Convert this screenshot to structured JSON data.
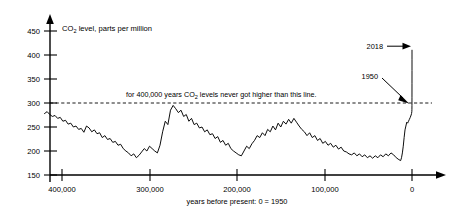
{
  "chart_data": {
    "type": "line",
    "title": "CO2 level, parts per million",
    "title_parts": {
      "pre": "CO",
      "sub": "2",
      "post": " level, parts per million"
    },
    "xlabel": "years before present: 0 = 1950",
    "ylabel": "CO2 level, parts per million",
    "xlim": [
      440000,
      -12000
    ],
    "ylim": [
      150,
      470
    ],
    "x_axis_direction": "decreasing-left-to-right",
    "grid": false,
    "legend": null,
    "y_ticks": [
      150,
      200,
      250,
      300,
      350,
      400,
      450
    ],
    "y_tick_labels": [
      "150",
      "200",
      "250",
      "300",
      "350",
      "400",
      "450"
    ],
    "x_ticks": [
      400000,
      300000,
      200000,
      100000,
      0
    ],
    "x_tick_labels": [
      "400,000",
      "300,000",
      "200,000",
      "100,000",
      "0"
    ],
    "threshold_line": {
      "value": 300,
      "style": "dashed",
      "label": "for 400,000 years CO2 levels never got higher than this line.",
      "label_parts": {
        "pre": "for 400,000 years CO",
        "sub": "2",
        "post": " levels never got higher than this line."
      }
    },
    "annotations": [
      {
        "label": "2018",
        "value": 410,
        "x": 0,
        "note": "arrow to top of modern spike"
      },
      {
        "label": "1950",
        "value": 310,
        "x": 0,
        "note": "arrow to where curve crosses the 300 ppm line"
      }
    ],
    "series": [
      {
        "name": "Ice core CO2 record",
        "points": [
          [
            420000,
            278
          ],
          [
            417000,
            282
          ],
          [
            414000,
            276
          ],
          [
            411000,
            272
          ],
          [
            408000,
            274
          ],
          [
            405000,
            268
          ],
          [
            402000,
            270
          ],
          [
            399000,
            262
          ],
          [
            396000,
            264
          ],
          [
            393000,
            256
          ],
          [
            390000,
            258
          ],
          [
            387000,
            250
          ],
          [
            384000,
            252
          ],
          [
            381000,
            245
          ],
          [
            378000,
            247
          ],
          [
            375000,
            239
          ],
          [
            372000,
            252
          ],
          [
            369000,
            248
          ],
          [
            366000,
            240
          ],
          [
            363000,
            244
          ],
          [
            360000,
            236
          ],
          [
            357000,
            238
          ],
          [
            354000,
            228
          ],
          [
            351000,
            232
          ],
          [
            348000,
            224
          ],
          [
            345000,
            226
          ],
          [
            342000,
            218
          ],
          [
            339000,
            220
          ],
          [
            336000,
            212
          ],
          [
            333000,
            214
          ],
          [
            330000,
            205
          ],
          [
            327000,
            200
          ],
          [
            324000,
            196
          ],
          [
            321000,
            190
          ],
          [
            318000,
            194
          ],
          [
            315000,
            186
          ],
          [
            312000,
            191
          ],
          [
            309000,
            198
          ],
          [
            306000,
            205
          ],
          [
            303000,
            200
          ],
          [
            300000,
            210
          ],
          [
            297000,
            205
          ],
          [
            294000,
            200
          ],
          [
            291000,
            196
          ],
          [
            288000,
            212
          ],
          [
            285000,
            240
          ],
          [
            282000,
            262
          ],
          [
            279000,
            255
          ],
          [
            276000,
            285
          ],
          [
            273000,
            295
          ],
          [
            270000,
            288
          ],
          [
            267000,
            280
          ],
          [
            264000,
            285
          ],
          [
            261000,
            272
          ],
          [
            258000,
            276
          ],
          [
            255000,
            262
          ],
          [
            252000,
            268
          ],
          [
            249000,
            255
          ],
          [
            246000,
            258
          ],
          [
            243000,
            248
          ],
          [
            240000,
            250
          ],
          [
            237000,
            240
          ],
          [
            234000,
            244
          ],
          [
            231000,
            234
          ],
          [
            228000,
            236
          ],
          [
            225000,
            226
          ],
          [
            222000,
            230
          ],
          [
            219000,
            218
          ],
          [
            216000,
            222
          ],
          [
            213000,
            212
          ],
          [
            210000,
            216
          ],
          [
            207000,
            205
          ],
          [
            204000,
            200
          ],
          [
            201000,
            196
          ],
          [
            198000,
            192
          ],
          [
            195000,
            190
          ],
          [
            192000,
            200
          ],
          [
            189000,
            210
          ],
          [
            186000,
            205
          ],
          [
            183000,
            215
          ],
          [
            180000,
            222
          ],
          [
            177000,
            232
          ],
          [
            174000,
            228
          ],
          [
            171000,
            238
          ],
          [
            168000,
            232
          ],
          [
            165000,
            245
          ],
          [
            162000,
            240
          ],
          [
            159000,
            252
          ],
          [
            156000,
            244
          ],
          [
            153000,
            258
          ],
          [
            150000,
            250
          ],
          [
            147000,
            262
          ],
          [
            144000,
            256
          ],
          [
            141000,
            266
          ],
          [
            138000,
            258
          ],
          [
            135000,
            268
          ],
          [
            132000,
            260
          ],
          [
            129000,
            252
          ],
          [
            126000,
            245
          ],
          [
            123000,
            240
          ],
          [
            120000,
            232
          ],
          [
            117000,
            238
          ],
          [
            114000,
            228
          ],
          [
            111000,
            232
          ],
          [
            108000,
            222
          ],
          [
            105000,
            226
          ],
          [
            102000,
            216
          ],
          [
            99000,
            220
          ],
          [
            96000,
            212
          ],
          [
            93000,
            216
          ],
          [
            90000,
            208
          ],
          [
            87000,
            212
          ],
          [
            84000,
            204
          ],
          [
            81000,
            208
          ],
          [
            78000,
            200
          ],
          [
            75000,
            198
          ],
          [
            72000,
            194
          ],
          [
            69000,
            192
          ],
          [
            66000,
            196
          ],
          [
            63000,
            190
          ],
          [
            60000,
            194
          ],
          [
            57000,
            188
          ],
          [
            54000,
            192
          ],
          [
            51000,
            186
          ],
          [
            48000,
            190
          ],
          [
            45000,
            185
          ],
          [
            42000,
            190
          ],
          [
            39000,
            186
          ],
          [
            36000,
            192
          ],
          [
            33000,
            188
          ],
          [
            30000,
            194
          ],
          [
            27000,
            190
          ],
          [
            24000,
            196
          ],
          [
            21000,
            192
          ],
          [
            18000,
            186
          ],
          [
            15000,
            182
          ],
          [
            13000,
            180
          ],
          [
            12000,
            186
          ],
          [
            11000,
            196
          ],
          [
            10000,
            210
          ],
          [
            9000,
            228
          ],
          [
            8000,
            244
          ],
          [
            7000,
            252
          ],
          [
            6000,
            260
          ],
          [
            5000,
            258
          ],
          [
            4000,
            262
          ],
          [
            3000,
            266
          ],
          [
            2000,
            270
          ],
          [
            1000,
            275
          ],
          [
            500,
            278
          ],
          [
            200,
            282
          ],
          [
            100,
            286
          ],
          [
            50,
            295
          ],
          [
            20,
            312
          ],
          [
            10,
            340
          ],
          [
            0,
            368
          ],
          [
            -5,
            390
          ],
          [
            -8,
            402
          ],
          [
            -10,
            410
          ]
        ]
      }
    ],
    "peaks_summary": {
      "note": "Glacial-interglacial cycles oscillate between ~180 ppm (glacial minima) and ~300 ppm (interglacial maxima); modern spike rises to ~410 ppm in 2018."
    }
  }
}
